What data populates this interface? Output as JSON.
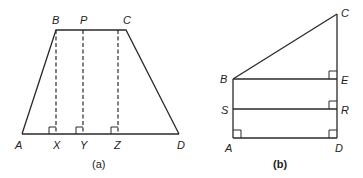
{
  "figure_a": {
    "caption": "(a)",
    "shape": "trapezium",
    "labels": {
      "A": "A",
      "B": "B",
      "C": "C",
      "D": "D",
      "P": "P",
      "X": "X",
      "Y": "Y",
      "Z": "Z"
    },
    "segments": [
      "AB",
      "BC",
      "CD",
      "AD"
    ],
    "dashed_perpendiculars": [
      "BX",
      "PY",
      "CZ"
    ],
    "right_angles": [
      "X",
      "Y",
      "Z"
    ]
  },
  "figure_b": {
    "caption": "(b)",
    "labels": {
      "A": "A",
      "B": "B",
      "C": "C",
      "D": "D",
      "E": "E",
      "R": "R",
      "S": "S"
    },
    "segments": [
      "AB",
      "BC",
      "CD",
      "AD",
      "BE",
      "SR"
    ],
    "right_angles": [
      "A",
      "D",
      "E",
      "R"
    ]
  },
  "colors": {
    "line": "#2a2a2a",
    "text": "#222222",
    "background": "#ffffff"
  }
}
